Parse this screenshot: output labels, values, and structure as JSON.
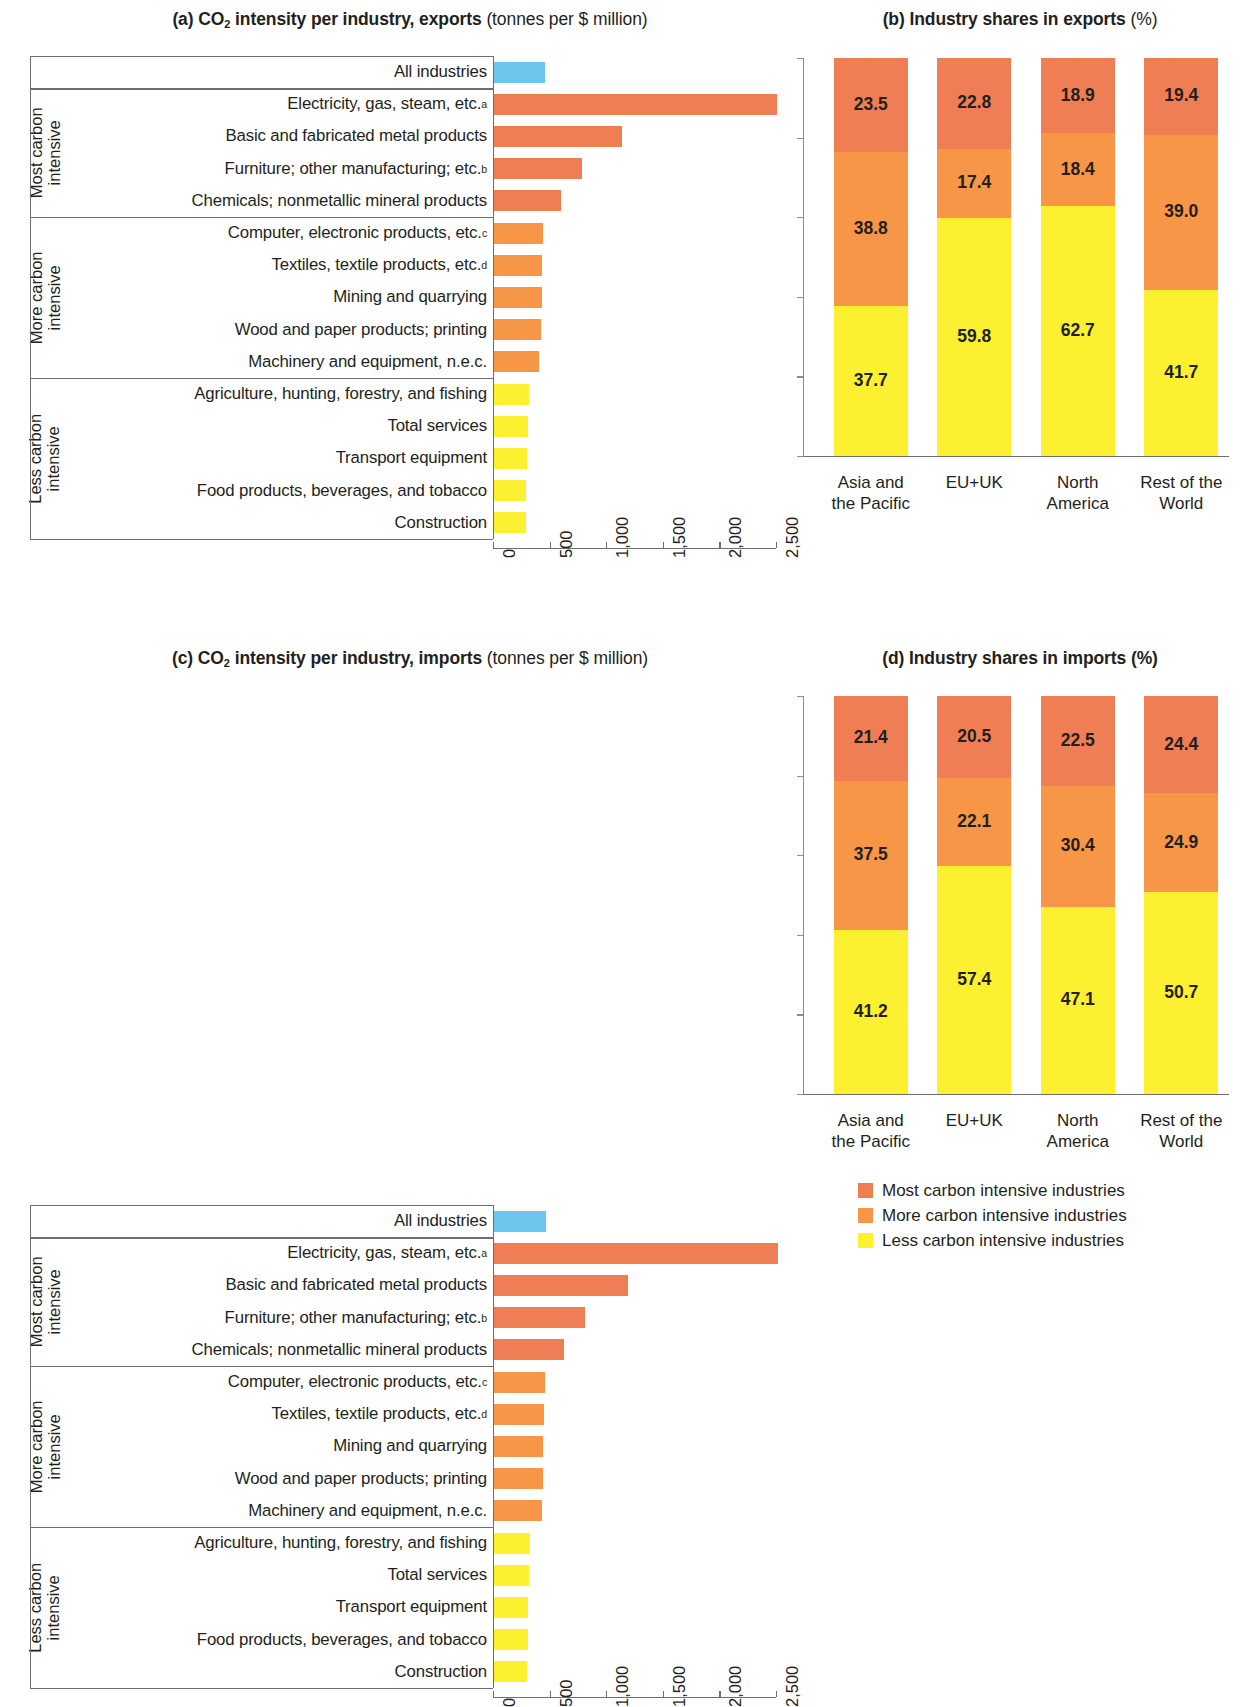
{
  "colors": {
    "most": "#ef7e55",
    "more": "#f79646",
    "less": "#fcf030",
    "all": "#6ec6ec",
    "rule": "#6d6e71",
    "text": "#231f20"
  },
  "panels": {
    "a": {
      "label": "(a)",
      "title_bold": "CO2 intensity per industry, exports",
      "title_light": "(tonnes per $ million)"
    },
    "b": {
      "label": "(b)",
      "title_bold": "Industry shares in exports",
      "title_light": "(%)"
    },
    "c": {
      "label": "(c)",
      "title_bold": "CO2 intensity per industry, imports",
      "title_light": "(tonnes per $ million)"
    },
    "d": {
      "label": "(d)",
      "title_bold": "Industry shares in imports (%)",
      "title_light": ""
    }
  },
  "group_labels": {
    "most": "Most carbon\nintensive",
    "more": "More carbon\nintensive",
    "less": "Less carbon\nintensive",
    "most_l1": "Most carbon",
    "most_l2": "intensive",
    "more_l1": "More carbon",
    "more_l2": "intensive",
    "less_l1": "Less carbon",
    "less_l2": "intensive"
  },
  "axis": {
    "ticks": [
      "0",
      "500",
      "1,000",
      "1,500",
      "2,000",
      "2,500"
    ],
    "min": 0,
    "max": 2500
  },
  "legend": [
    {
      "label": "Most carbon intensive industries",
      "color": "#ef7e55"
    },
    {
      "label": "More carbon intensive industries",
      "color": "#f79646"
    },
    {
      "label": "Less carbon intensive industries",
      "color": "#fcf030"
    }
  ],
  "chart_data": [
    {
      "type": "bar",
      "panel": "a",
      "title": "(a) CO2 intensity per industry, exports (tonnes per $ million)",
      "xlabel": "tonnes per $ million",
      "ylabel": "",
      "xlim": [
        0,
        2500
      ],
      "orientation": "horizontal",
      "grid": false,
      "ticks": [
        "0",
        "500",
        "1,000",
        "1,500",
        "2,000",
        "2,500"
      ],
      "categories": [
        "All industries",
        "Electricity, gas, steam, etc.a",
        "Basic and fabricated metal products",
        "Furniture; other manufacturing; etc.b",
        "Chemicals; nonmetallic mineral products",
        "Computer, electronic products, etc.c",
        "Textiles, textile products, etc.d",
        "Mining and quarrying",
        "Wood and paper products; printing",
        "Machinery and equipment, n.e.c.",
        "Agriculture, hunting, forestry, and fishing",
        "Total services",
        "Transport equipment",
        "Food products, beverages, and tobacco",
        "Construction"
      ],
      "values": [
        460,
        2505,
        1140,
        790,
        605,
        445,
        435,
        430,
        420,
        405,
        320,
        305,
        300,
        295,
        290
      ],
      "bar_groups": [
        "all",
        "most",
        "most",
        "most",
        "most",
        "more",
        "more",
        "more",
        "more",
        "more",
        "less",
        "less",
        "less",
        "less",
        "less"
      ]
    },
    {
      "type": "bar",
      "panel": "c",
      "title": "(c) CO2 intensity per industry, imports (tonnes per $ million)",
      "xlabel": "tonnes per $ million",
      "ylabel": "",
      "xlim": [
        0,
        2500
      ],
      "orientation": "horizontal",
      "grid": false,
      "ticks": [
        "0",
        "500",
        "1,000",
        "1,500",
        "2,000",
        "2,500"
      ],
      "categories": [
        "All industries",
        "Electricity, gas, steam, etc.a",
        "Basic and fabricated metal products",
        "Furniture; other manufacturing; etc.b",
        "Chemicals; nonmetallic mineral products",
        "Computer, electronic products, etc.c",
        "Textiles, textile products, etc.d",
        "Mining and quarrying",
        "Wood and paper products; printing",
        "Machinery and equipment, n.e.c.",
        "Agriculture, hunting, forestry, and fishing",
        "Total services",
        "Transport equipment",
        "Food products, beverages, and tobacco",
        "Construction"
      ],
      "values": [
        470,
        2520,
        1190,
        810,
        625,
        460,
        450,
        445,
        440,
        430,
        330,
        315,
        310,
        305,
        300
      ],
      "bar_groups": [
        "all",
        "most",
        "most",
        "most",
        "most",
        "more",
        "more",
        "more",
        "more",
        "more",
        "less",
        "less",
        "less",
        "less",
        "less"
      ]
    },
    {
      "type": "bar",
      "panel": "b",
      "stacked": true,
      "title": "(b) Industry shares in exports (%)",
      "ylabel": "%",
      "ylim": [
        0,
        100
      ],
      "categories": [
        "Asia and the Pacific",
        "EU+UK",
        "North America",
        "Rest of the World"
      ],
      "category_lines": [
        [
          "Asia and",
          "the Pacific"
        ],
        [
          "EU+UK",
          ""
        ],
        [
          "North",
          "America"
        ],
        [
          "Rest of the",
          "World"
        ]
      ],
      "series": [
        {
          "name": "Less carbon intensive industries",
          "color": "#fcf030",
          "values": [
            37.7,
            59.8,
            62.7,
            41.7
          ]
        },
        {
          "name": "More carbon intensive industries",
          "color": "#f79646",
          "values": [
            38.8,
            17.4,
            18.4,
            39.0
          ]
        },
        {
          "name": "Most carbon intensive industries",
          "color": "#ef7e55",
          "values": [
            23.5,
            22.8,
            18.9,
            19.4
          ]
        }
      ]
    },
    {
      "type": "bar",
      "panel": "d",
      "stacked": true,
      "title": "(d) Industry shares in imports (%)",
      "ylabel": "%",
      "ylim": [
        0,
        100
      ],
      "categories": [
        "Asia and the Pacific",
        "EU+UK",
        "North America",
        "Rest of the World"
      ],
      "category_lines": [
        [
          "Asia and",
          "the Pacific"
        ],
        [
          "EU+UK",
          ""
        ],
        [
          "North",
          "America"
        ],
        [
          "Rest of the",
          "World"
        ]
      ],
      "series": [
        {
          "name": "Less carbon intensive industries",
          "color": "#fcf030",
          "values": [
            41.2,
            57.4,
            47.1,
            50.7
          ]
        },
        {
          "name": "More carbon intensive industries",
          "color": "#f79646",
          "values": [
            37.5,
            22.1,
            30.4,
            24.9
          ]
        },
        {
          "name": "Most carbon intensive industries",
          "color": "#ef7e55",
          "values": [
            21.4,
            20.5,
            22.5,
            24.4
          ]
        }
      ]
    }
  ]
}
